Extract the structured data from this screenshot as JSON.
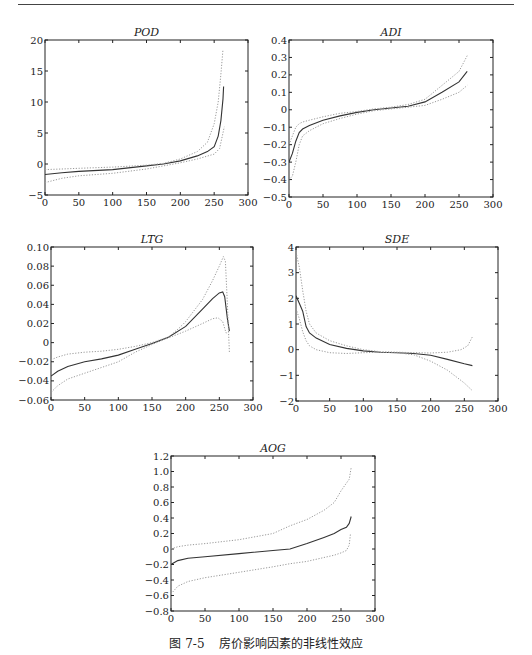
{
  "figure": {
    "caption_number": "图 7-5",
    "caption_text": "房价影响因素的非线性效应"
  },
  "chart_data": [
    {
      "type": "line",
      "title": "POD",
      "xlim": [
        0,
        300
      ],
      "ylim": [
        -5,
        20
      ],
      "xticks": [
        0,
        50,
        100,
        150,
        200,
        250,
        300
      ],
      "yticks": [
        -5,
        0,
        5,
        10,
        15,
        20
      ],
      "grid": false,
      "series": [
        {
          "name": "estimate",
          "style": "solid",
          "x": [
            0,
            25,
            50,
            100,
            150,
            175,
            200,
            225,
            240,
            250,
            256,
            260,
            263,
            264
          ],
          "y": [
            -1.7,
            -1.4,
            -1.2,
            -0.9,
            -0.3,
            0.0,
            0.5,
            1.3,
            2.0,
            2.8,
            4.5,
            7.0,
            10.5,
            12.5
          ]
        },
        {
          "name": "upper band",
          "style": "dotted",
          "x": [
            0,
            25,
            50,
            100,
            150,
            175,
            200,
            225,
            240,
            250,
            256,
            260,
            263
          ],
          "y": [
            -0.9,
            -0.8,
            -0.7,
            -0.5,
            -0.2,
            0.1,
            0.8,
            2.0,
            3.5,
            6.5,
            10.0,
            14.5,
            18.5
          ]
        },
        {
          "name": "lower band",
          "style": "dotted",
          "x": [
            0,
            25,
            50,
            100,
            150,
            175,
            200,
            225,
            250,
            258,
            262,
            265
          ],
          "y": [
            -3.0,
            -2.3,
            -1.9,
            -1.5,
            -0.8,
            -0.3,
            0.2,
            0.8,
            1.6,
            2.5,
            4.5,
            6.0
          ]
        }
      ]
    },
    {
      "type": "line",
      "title": "ADI",
      "xlim": [
        0,
        300
      ],
      "ylim": [
        -0.5,
        0.4
      ],
      "xticks": [
        0,
        50,
        100,
        150,
        200,
        250,
        300
      ],
      "yticks": [
        -0.5,
        -0.4,
        -0.3,
        -0.2,
        -0.1,
        0,
        0.1,
        0.2,
        0.3,
        0.4
      ],
      "grid": false,
      "series": [
        {
          "name": "estimate",
          "style": "solid",
          "x": [
            0,
            5,
            10,
            15,
            20,
            30,
            50,
            75,
            100,
            125,
            150,
            175,
            200,
            225,
            250,
            262
          ],
          "y": [
            -0.3,
            -0.25,
            -0.18,
            -0.13,
            -0.11,
            -0.09,
            -0.06,
            -0.035,
            -0.015,
            0.0,
            0.01,
            0.02,
            0.045,
            0.1,
            0.16,
            0.22
          ]
        },
        {
          "name": "upper band",
          "style": "dotted",
          "x": [
            0,
            5,
            10,
            15,
            20,
            30,
            50,
            75,
            100,
            125,
            150,
            175,
            200,
            225,
            250,
            262
          ],
          "y": [
            -0.2,
            -0.15,
            -0.1,
            -0.08,
            -0.07,
            -0.06,
            -0.04,
            -0.02,
            -0.01,
            0.005,
            0.015,
            0.03,
            0.06,
            0.14,
            0.22,
            0.31
          ]
        },
        {
          "name": "lower band",
          "style": "dotted",
          "x": [
            0,
            5,
            10,
            15,
            20,
            30,
            50,
            75,
            100,
            125,
            150,
            175,
            200,
            225,
            250,
            262
          ],
          "y": [
            -0.4,
            -0.38,
            -0.3,
            -0.2,
            -0.15,
            -0.12,
            -0.08,
            -0.05,
            -0.025,
            -0.005,
            0.005,
            0.015,
            0.025,
            0.06,
            0.1,
            0.14
          ]
        }
      ]
    },
    {
      "type": "line",
      "title": "LTG",
      "xlim": [
        0,
        300
      ],
      "ylim": [
        -0.06,
        0.1
      ],
      "xticks": [
        0,
        50,
        100,
        150,
        200,
        250,
        300
      ],
      "yticks": [
        -0.06,
        -0.04,
        -0.02,
        0,
        0.02,
        0.04,
        0.06,
        0.08,
        0.1
      ],
      "ytick_labels": [
        "−0.06",
        "−0.04",
        "−0.02",
        "0",
        "0.02",
        "0.04",
        "0.06",
        "0.08",
        "0.10"
      ],
      "grid": false,
      "series": [
        {
          "name": "estimate",
          "style": "solid",
          "x": [
            0,
            10,
            25,
            50,
            75,
            100,
            125,
            150,
            175,
            200,
            225,
            240,
            250,
            255,
            258,
            262,
            265
          ],
          "y": [
            -0.035,
            -0.03,
            -0.025,
            -0.02,
            -0.017,
            -0.013,
            -0.007,
            -0.001,
            0.006,
            0.017,
            0.035,
            0.046,
            0.052,
            0.053,
            0.048,
            0.025,
            0.012
          ]
        },
        {
          "name": "upper band",
          "style": "dotted",
          "x": [
            0,
            10,
            25,
            50,
            75,
            100,
            125,
            150,
            175,
            190,
            200,
            225,
            240,
            250,
            256,
            259,
            262,
            265
          ],
          "y": [
            -0.018,
            -0.015,
            -0.012,
            -0.01,
            -0.009,
            -0.007,
            -0.004,
            0.0,
            0.006,
            0.015,
            0.022,
            0.045,
            0.065,
            0.08,
            0.09,
            0.085,
            0.04,
            -0.01
          ]
        },
        {
          "name": "lower band",
          "style": "dotted",
          "x": [
            0,
            10,
            25,
            50,
            75,
            100,
            125,
            150,
            175,
            200,
            225,
            240,
            248,
            255,
            260,
            265
          ],
          "y": [
            -0.052,
            -0.045,
            -0.038,
            -0.032,
            -0.026,
            -0.02,
            -0.01,
            -0.002,
            0.005,
            0.012,
            0.02,
            0.025,
            0.026,
            0.022,
            0.01,
            0.012
          ]
        }
      ]
    },
    {
      "type": "line",
      "title": "SDE",
      "xlim": [
        0,
        300
      ],
      "ylim": [
        -2,
        4
      ],
      "xticks": [
        0,
        50,
        100,
        150,
        200,
        250,
        300
      ],
      "yticks": [
        -2,
        -1,
        0,
        1,
        2,
        3,
        4
      ],
      "grid": false,
      "series": [
        {
          "name": "estimate",
          "style": "solid",
          "x": [
            0,
            5,
            10,
            15,
            20,
            30,
            50,
            75,
            100,
            125,
            150,
            175,
            200,
            225,
            250,
            262
          ],
          "y": [
            2.1,
            1.8,
            1.5,
            0.9,
            0.65,
            0.45,
            0.2,
            0.05,
            -0.05,
            -0.1,
            -0.12,
            -0.15,
            -0.22,
            -0.38,
            -0.55,
            -0.62
          ]
        },
        {
          "name": "upper band",
          "style": "dotted",
          "x": [
            0,
            5,
            10,
            15,
            20,
            30,
            50,
            75,
            100,
            125,
            150,
            175,
            200,
            225,
            245,
            255,
            262
          ],
          "y": [
            3.8,
            3.2,
            2.3,
            1.5,
            1.0,
            0.65,
            0.35,
            0.15,
            0.0,
            -0.08,
            -0.1,
            -0.12,
            -0.13,
            -0.1,
            0.0,
            0.15,
            0.5
          ]
        },
        {
          "name": "lower band",
          "style": "dotted",
          "x": [
            0,
            5,
            10,
            15,
            20,
            30,
            50,
            75,
            100,
            125,
            150,
            175,
            200,
            225,
            250,
            262
          ],
          "y": [
            1.6,
            1.2,
            0.7,
            0.35,
            0.15,
            0.0,
            -0.12,
            -0.15,
            -0.12,
            -0.1,
            -0.12,
            -0.2,
            -0.45,
            -0.8,
            -1.3,
            -1.6
          ]
        }
      ]
    },
    {
      "type": "line",
      "title": "AOG",
      "xlim": [
        0,
        300
      ],
      "ylim": [
        -0.8,
        1.2
      ],
      "xticks": [
        0,
        50,
        100,
        150,
        200,
        250,
        300
      ],
      "yticks": [
        -0.8,
        -0.6,
        -0.4,
        -0.2,
        0,
        0.2,
        0.4,
        0.6,
        0.8,
        1.0,
        1.2
      ],
      "ytick_labels": [
        "−0.8",
        "−0.6",
        "−0.4",
        "−0.2",
        "0",
        "0.2",
        "0.4",
        "0.6",
        "0.8",
        "1.0",
        "1.2"
      ],
      "grid": false,
      "series": [
        {
          "name": "estimate",
          "style": "solid",
          "x": [
            0,
            10,
            25,
            50,
            100,
            150,
            175,
            200,
            225,
            240,
            250,
            258,
            262,
            265
          ],
          "y": [
            -0.2,
            -0.15,
            -0.12,
            -0.1,
            -0.06,
            -0.02,
            0.0,
            0.07,
            0.15,
            0.2,
            0.25,
            0.28,
            0.33,
            0.42
          ]
        },
        {
          "name": "upper band",
          "style": "dotted",
          "x": [
            0,
            10,
            25,
            50,
            100,
            150,
            175,
            200,
            225,
            240,
            250,
            258,
            262,
            265
          ],
          "y": [
            0.0,
            0.03,
            0.05,
            0.07,
            0.12,
            0.2,
            0.3,
            0.38,
            0.5,
            0.6,
            0.75,
            0.85,
            0.9,
            1.05
          ]
        },
        {
          "name": "lower band",
          "style": "dotted",
          "x": [
            0,
            10,
            25,
            50,
            100,
            150,
            175,
            200,
            225,
            240,
            250,
            258,
            262,
            264
          ],
          "y": [
            -0.58,
            -0.48,
            -0.42,
            -0.37,
            -0.3,
            -0.23,
            -0.19,
            -0.16,
            -0.11,
            -0.08,
            -0.05,
            -0.02,
            0.05,
            0.2
          ]
        }
      ]
    }
  ],
  "layout": {
    "colors": {
      "axis": "#222222",
      "estimate": "#333333",
      "band": "#9a9a9a"
    },
    "boxes": [
      {
        "x0": 45,
        "y0": 40,
        "x1": 248,
        "y1": 195
      },
      {
        "x0": 289,
        "y0": 40,
        "x1": 493,
        "y1": 197
      },
      {
        "x0": 51,
        "y0": 247,
        "x1": 253,
        "y1": 400
      },
      {
        "x0": 296,
        "y0": 247,
        "x1": 498,
        "y1": 401
      },
      {
        "x0": 171,
        "y0": 456,
        "x1": 375,
        "y1": 611
      }
    ]
  }
}
